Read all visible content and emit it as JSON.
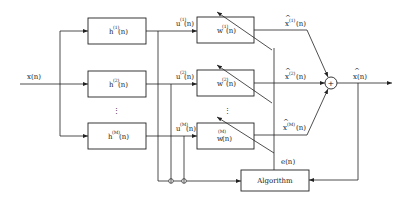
{
  "diagram": {
    "type": "adaptive filter block diagram (subband / filter bank structure)",
    "input": {
      "label": "x(n)"
    },
    "output": {
      "label": "x̂(n)",
      "hat": "^",
      "base": "x(n)"
    },
    "error": {
      "label": "e(n)"
    },
    "algorithm_block": {
      "label": "Algorithm"
    },
    "ellipsis": "⋮",
    "summer": {
      "symbol": "+"
    },
    "branches": [
      {
        "h": {
          "base": "h",
          "sup": "(1)",
          "arg": "(n)"
        },
        "u": {
          "base": "u",
          "sup": "(1)",
          "arg": "(n)"
        },
        "w": {
          "base": "w",
          "sup": "(1)",
          "arg": "(n)"
        },
        "xhat": {
          "hat": "^",
          "base": "x",
          "sup": "(1)",
          "arg": "(n)"
        }
      },
      {
        "h": {
          "base": "h",
          "sup": "(2)",
          "arg": "(n)"
        },
        "u": {
          "base": "u",
          "sup": "(2)",
          "arg": "(n)"
        },
        "w": {
          "base": "w",
          "sup": "(2)",
          "arg": "(n)"
        },
        "xhat": {
          "hat": "^",
          "base": "x",
          "sup": "(2)",
          "arg": "(n)"
        }
      },
      {
        "h": {
          "base": "h",
          "sup": "(M)",
          "arg": "(n)"
        },
        "u": {
          "base": "u",
          "sup": "(M)",
          "arg": "(n)"
        },
        "w": {
          "base": "w",
          "sup": "(M)",
          "arg": "(n)"
        },
        "xhat": {
          "hat": "^",
          "base": "x",
          "sup": "(M)",
          "arg": "(n)"
        }
      }
    ]
  }
}
